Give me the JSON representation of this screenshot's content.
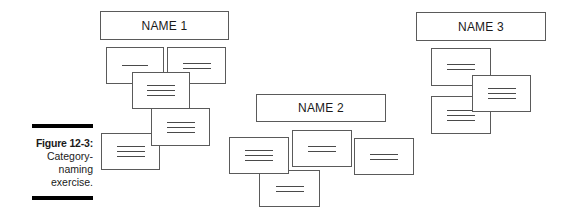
{
  "caption": {
    "label": "Figure 12-3:",
    "lines": [
      "Category-",
      "naming",
      "exercise."
    ]
  },
  "groups": [
    {
      "name": "NAME 1",
      "box": {
        "x": 100,
        "y": 11,
        "w": 129,
        "h": 29
      },
      "cards": [
        {
          "x": 106,
          "y": 47,
          "w": 58,
          "h": 37,
          "lines": 1,
          "z": 1
        },
        {
          "x": 167,
          "y": 47,
          "w": 59,
          "h": 37,
          "lines": 2,
          "z": 1
        },
        {
          "x": 132,
          "y": 72,
          "w": 58,
          "h": 37,
          "lines": 3,
          "z": 2
        },
        {
          "x": 101,
          "y": 133,
          "w": 59,
          "h": 37,
          "lines": 3,
          "z": 3
        },
        {
          "x": 151,
          "y": 108,
          "w": 59,
          "h": 38,
          "lines": 3,
          "z": 4
        }
      ]
    },
    {
      "name": "NAME 2",
      "box": {
        "x": 256,
        "y": 94,
        "w": 130,
        "h": 28
      },
      "cards": [
        {
          "x": 259,
          "y": 170,
          "w": 61,
          "h": 37,
          "lines": 2,
          "z": 1
        },
        {
          "x": 229,
          "y": 137,
          "w": 60,
          "h": 37,
          "lines": 3,
          "z": 2
        },
        {
          "x": 292,
          "y": 130,
          "w": 60,
          "h": 37,
          "lines": 2,
          "z": 2
        },
        {
          "x": 354,
          "y": 138,
          "w": 60,
          "h": 37,
          "lines": 2,
          "z": 2
        }
      ]
    },
    {
      "name": "NAME 3",
      "box": {
        "x": 416,
        "y": 12,
        "w": 130,
        "h": 29
      },
      "cards": [
        {
          "x": 431,
          "y": 48,
          "w": 60,
          "h": 38,
          "lines": 2,
          "z": 1
        },
        {
          "x": 431,
          "y": 96,
          "w": 60,
          "h": 38,
          "lines": 3,
          "z": 2
        },
        {
          "x": 472,
          "y": 75,
          "w": 59,
          "h": 37,
          "lines": 3,
          "z": 3
        }
      ]
    }
  ],
  "colors": {
    "border": "#5a5a5a",
    "line": "#4a4a4a",
    "caption_bar": "#000000",
    "text": "#1a1a1a",
    "background": "#ffffff"
  }
}
